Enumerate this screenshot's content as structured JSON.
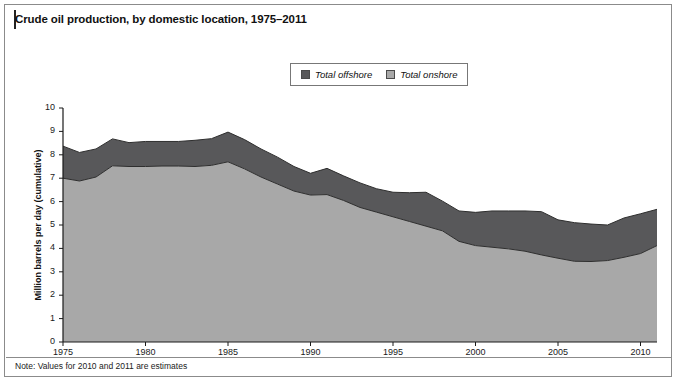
{
  "figure": {
    "title": "Crude oil production, by domestic location, 1975–2011",
    "note": "Note: Values for 2010 and 2011 are estimates"
  },
  "legend": {
    "position": "top-center",
    "items": [
      {
        "label": "Total offshore",
        "color": "#58585a"
      },
      {
        "label": "Total onshore",
        "color": "#a8a8a8"
      }
    ]
  },
  "axes": {
    "y_ticks": [
      "10",
      "9",
      "8",
      "7",
      "6",
      "5",
      "4",
      "3",
      "2",
      "1",
      "0"
    ],
    "x_ticks": [
      "1975",
      "1980",
      "1985",
      "1990",
      "1995",
      "2000",
      "2005",
      "2010"
    ]
  },
  "chart_data": {
    "type": "area",
    "title": "Crude oil production, by domestic location, 1975–2011",
    "xlabel": "",
    "ylabel": "Million barrels per day (cumulative)",
    "stacked": true,
    "grid": false,
    "legend_position": "top-center",
    "xlim": [
      1975,
      2011
    ],
    "ylim": [
      0,
      10
    ],
    "x": [
      1975,
      1976,
      1977,
      1978,
      1979,
      1980,
      1981,
      1982,
      1983,
      1984,
      1985,
      1986,
      1987,
      1988,
      1989,
      1990,
      1991,
      1992,
      1993,
      1994,
      1995,
      1996,
      1997,
      1998,
      1999,
      2000,
      2001,
      2002,
      2003,
      2004,
      2005,
      2006,
      2007,
      2008,
      2009,
      2010,
      2011
    ],
    "series": [
      {
        "name": "Total onshore",
        "color": "#a8a8a8",
        "values": [
          7.0,
          6.88,
          7.05,
          7.53,
          7.5,
          7.5,
          7.52,
          7.52,
          7.5,
          7.55,
          7.7,
          7.4,
          7.05,
          6.75,
          6.45,
          6.28,
          6.3,
          6.05,
          5.75,
          5.55,
          5.35,
          5.15,
          4.95,
          4.75,
          4.3,
          4.12,
          4.05,
          3.98,
          3.88,
          3.72,
          3.58,
          3.45,
          3.44,
          3.48,
          3.62,
          3.78,
          4.12
        ]
      },
      {
        "name": "Total offshore",
        "color": "#58585a",
        "values": [
          1.37,
          1.22,
          1.2,
          1.15,
          1.02,
          1.07,
          1.05,
          1.05,
          1.12,
          1.14,
          1.27,
          1.25,
          1.2,
          1.15,
          1.05,
          0.93,
          1.12,
          1.05,
          1.05,
          1.0,
          1.05,
          1.23,
          1.45,
          1.27,
          1.3,
          1.42,
          1.55,
          1.62,
          1.72,
          1.85,
          1.64,
          1.65,
          1.6,
          1.52,
          1.68,
          1.7,
          1.55
        ]
      }
    ],
    "totals": [
      8.37,
      8.1,
      8.25,
      8.68,
      8.52,
      8.57,
      8.57,
      8.57,
      8.62,
      8.69,
      8.97,
      8.65,
      8.25,
      7.9,
      7.5,
      7.21,
      7.42,
      7.1,
      6.8,
      6.55,
      6.4,
      6.38,
      6.4,
      6.02,
      5.6,
      5.54,
      5.6,
      5.6,
      5.6,
      5.57,
      5.22,
      5.1,
      5.04,
      5.0,
      5.3,
      5.48,
      5.67
    ]
  }
}
